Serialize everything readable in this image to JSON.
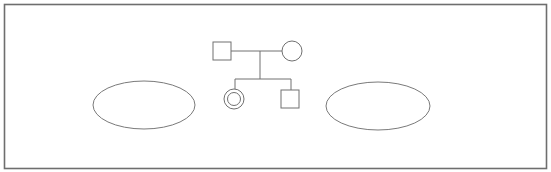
{
  "diagram": {
    "type": "pedigree",
    "colors": {
      "background": "#ffffff",
      "frame": "#6e6e6e",
      "stroke": "#707070",
      "ellipse_stroke": "#7a7a7a"
    },
    "frame": {
      "x": 4.5,
      "y": 4.5,
      "width": 542,
      "height": 164
    },
    "nodes": [
      {
        "id": "father",
        "shape": "square",
        "sex": "male",
        "x": 213,
        "y": 42,
        "size": 18
      },
      {
        "id": "mother",
        "shape": "circle",
        "sex": "female",
        "cx": 292,
        "cy": 51,
        "r": 10
      },
      {
        "id": "daughter",
        "shape": "double-circle",
        "sex": "female",
        "cx": 234,
        "cy": 99,
        "r": 10,
        "inner_r": 6.5
      },
      {
        "id": "son",
        "shape": "square",
        "sex": "male",
        "x": 281,
        "y": 90,
        "size": 18
      }
    ],
    "edges": [
      {
        "id": "marriage-line",
        "x1": 231,
        "y1": 51,
        "x2": 282,
        "y2": 51
      },
      {
        "id": "descent-line",
        "x1": 260,
        "y1": 51,
        "x2": 260,
        "y2": 79
      },
      {
        "id": "sibship-line",
        "x1": 235,
        "y1": 79,
        "x2": 291,
        "y2": 79
      },
      {
        "id": "daughter-drop-line",
        "x1": 235,
        "y1": 79,
        "x2": 235,
        "y2": 89
      },
      {
        "id": "son-drop-line",
        "x1": 291,
        "y1": 79,
        "x2": 291,
        "y2": 90
      }
    ],
    "ellipses": [
      {
        "id": "left-ellipse",
        "cx": 144,
        "cy": 105,
        "rx": 51,
        "ry": 24
      },
      {
        "id": "right-ellipse",
        "cx": 378,
        "cy": 106,
        "rx": 52,
        "ry": 24
      }
    ]
  }
}
